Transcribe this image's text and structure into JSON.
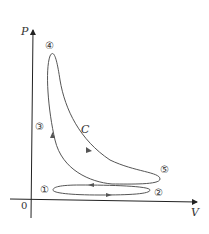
{
  "axes": {
    "y_label": "P",
    "x_label": "V",
    "origin_label": "0"
  },
  "curve_label": "C",
  "points": [
    {
      "id": "1",
      "label": "①"
    },
    {
      "id": "2",
      "label": "②"
    },
    {
      "id": "3",
      "label": "③"
    },
    {
      "id": "4",
      "label": "④"
    },
    {
      "id": "5",
      "label": "⑤"
    }
  ],
  "colors": {
    "axis": "#222222",
    "curve": "#555555",
    "text": "#333333"
  }
}
